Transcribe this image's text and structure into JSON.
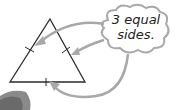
{
  "diagram": {
    "callout_line1": "3 equal",
    "callout_line2": "sides.",
    "shape": "equilateral-triangle",
    "tick_marks": 3,
    "arrows": 3,
    "colors": {
      "stroke": "#2a2a2a",
      "arrow": "#a8a8a8",
      "cloud_border": "#a8a8a8",
      "text": "#222222"
    }
  }
}
